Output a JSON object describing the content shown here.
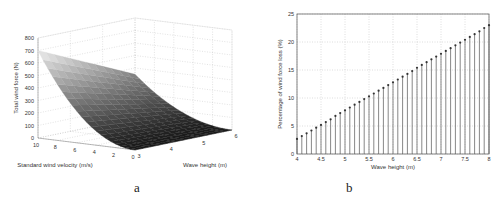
{
  "captions": {
    "a": "a",
    "b": "b"
  },
  "chart_data": [
    {
      "id": "a",
      "type": "surface3d",
      "title": "",
      "xlabel": "Standard wind velocity (m/s)",
      "ylabel": "Wave height (m)",
      "zlabel": "Total wind force (N)",
      "x_ticks": [
        "0",
        "2",
        "4",
        "6",
        "8",
        "10"
      ],
      "y_ticks": [
        "3",
        "4",
        "5",
        "6"
      ],
      "z_ticks": [
        "0",
        "100",
        "200",
        "300",
        "400",
        "500",
        "600",
        "700",
        "800"
      ],
      "xlim": [
        0,
        10
      ],
      "ylim": [
        3,
        6
      ],
      "zlim": [
        0,
        800
      ],
      "grid": true,
      "surface_samples": [
        {
          "velocity": 10,
          "wave_height": 3,
          "force": 700
        },
        {
          "velocity": 10,
          "wave_height": 6,
          "force": 350
        },
        {
          "velocity": 0,
          "wave_height": 3,
          "force": 0
        },
        {
          "velocity": 0,
          "wave_height": 6,
          "force": 0
        }
      ],
      "colormap": "gray"
    },
    {
      "id": "b",
      "type": "stem",
      "title": "",
      "xlabel": "Wave height (m)",
      "ylabel": "Percentage of wind force loss (%)",
      "x_ticks": [
        "4",
        "4.5",
        "5",
        "5.5",
        "6",
        "6.5",
        "7",
        "7.5",
        "8"
      ],
      "y_ticks": [
        "0",
        "5",
        "10",
        "15",
        "20",
        "25"
      ],
      "xlim": [
        4,
        8
      ],
      "ylim": [
        0,
        25
      ],
      "grid": true,
      "x": [
        4.0,
        4.1,
        4.2,
        4.3,
        4.4,
        4.5,
        4.6,
        4.7,
        4.8,
        4.9,
        5.0,
        5.1,
        5.2,
        5.3,
        5.4,
        5.5,
        5.6,
        5.7,
        5.8,
        5.9,
        6.0,
        6.1,
        6.2,
        6.3,
        6.4,
        6.5,
        6.6,
        6.7,
        6.8,
        6.9,
        7.0,
        7.1,
        7.2,
        7.3,
        7.4,
        7.5,
        7.6,
        7.7,
        7.8,
        7.9,
        8.0
      ],
      "values": [
        2.7,
        3.2,
        3.7,
        4.2,
        4.7,
        5.2,
        5.7,
        6.2,
        6.8,
        7.3,
        7.8,
        8.3,
        8.8,
        9.3,
        9.8,
        10.3,
        10.8,
        11.3,
        11.8,
        12.3,
        12.8,
        13.3,
        13.8,
        14.3,
        14.8,
        15.4,
        15.9,
        16.4,
        16.9,
        17.4,
        17.9,
        18.4,
        18.9,
        19.4,
        19.9,
        20.4,
        20.9,
        21.4,
        21.9,
        22.5,
        23.0
      ]
    }
  ]
}
